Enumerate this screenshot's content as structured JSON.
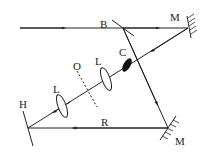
{
  "diagram": {
    "title": "",
    "labels": {
      "beam_splitter": "B",
      "mirror_top": "M",
      "mirror_bottom": "M",
      "crystal": "C",
      "lens_right": "L",
      "lens_left": "L",
      "object_plane": "O",
      "hologram": "H",
      "reference_beam": "R"
    },
    "colors": {
      "line": "#222222",
      "background": "#ffffff"
    }
  }
}
